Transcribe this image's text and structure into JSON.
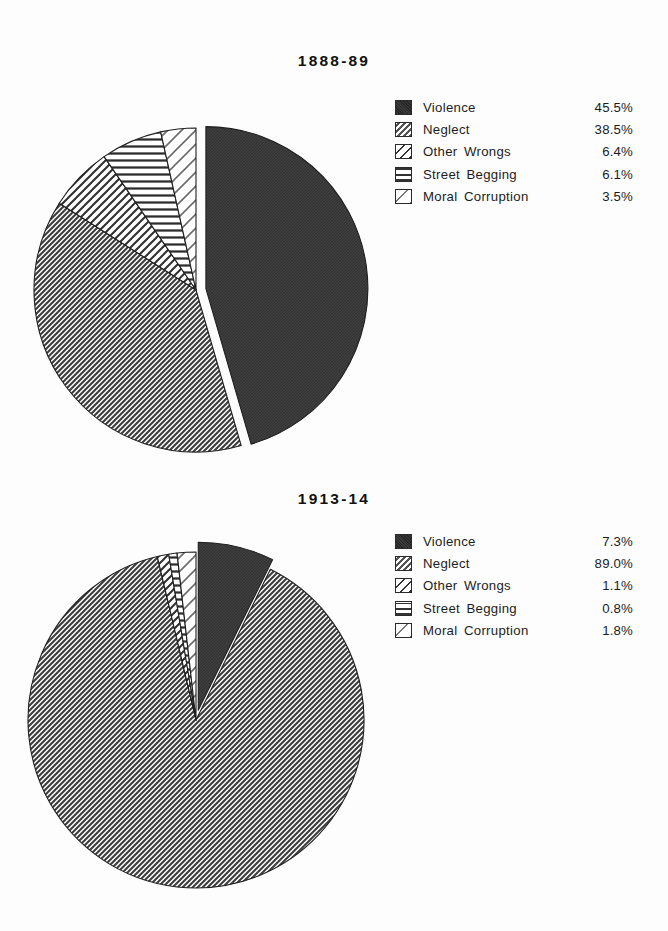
{
  "document": {
    "background": "#fdfdfd",
    "ink": "#1c1c1c"
  },
  "charts": [
    {
      "title": "1888-89",
      "legend": [
        {
          "label": "Violence",
          "value": "45.5%",
          "pattern": "solid",
          "swatch_name": "swatch-violence"
        },
        {
          "label": "Neglect",
          "value": "38.5%",
          "pattern": "dense-diag",
          "swatch_name": "swatch-neglect"
        },
        {
          "label": "Other Wrongs",
          "value": "6.4%",
          "pattern": "wide-diag",
          "swatch_name": "swatch-other-wrongs"
        },
        {
          "label": "Street Begging",
          "value": "6.1%",
          "pattern": "horiz",
          "swatch_name": "swatch-street-begging"
        },
        {
          "label": "Moral Corruption",
          "value": "3.5%",
          "pattern": "sparse-diag",
          "swatch_name": "swatch-moral-corruption"
        }
      ]
    },
    {
      "title": "1913-14",
      "legend": [
        {
          "label": "Violence",
          "value": "7.3%",
          "pattern": "solid",
          "swatch_name": "swatch-violence"
        },
        {
          "label": "Neglect",
          "value": "89.0%",
          "pattern": "dense-diag",
          "swatch_name": "swatch-neglect"
        },
        {
          "label": "Other Wrongs",
          "value": "1.1%",
          "pattern": "wide-diag",
          "swatch_name": "swatch-other-wrongs"
        },
        {
          "label": "Street Begging",
          "value": "0.8%",
          "pattern": "horiz",
          "swatch_name": "swatch-street-begging"
        },
        {
          "label": "Moral Corruption",
          "value": "1.8%",
          "pattern": "sparse-diag",
          "swatch_name": "swatch-moral-corruption"
        }
      ]
    }
  ],
  "chart_data": [
    {
      "type": "pie",
      "title": "1888-89",
      "labels": [
        "Violence",
        "Neglect",
        "Other Wrongs",
        "Street Begging",
        "Moral Corruption"
      ],
      "values": [
        45.5,
        38.5,
        6.4,
        6.1,
        3.5
      ],
      "value_labels": [
        "45.5%",
        "38.5%",
        "6.4%",
        "6.1%",
        "3.5%"
      ],
      "units": "percent",
      "total": 100.0,
      "start_angle_deg": 0,
      "direction": "clockwise",
      "exploded_slices": [
        "Violence"
      ],
      "explode_offset_px": 10,
      "slice_fills": [
        "solid-dark",
        "dense-diagonal",
        "wide-diagonal",
        "horizontal-lines",
        "sparse-diagonal"
      ],
      "legend_position": "right",
      "grid": false
    },
    {
      "type": "pie",
      "title": "1913-14",
      "labels": [
        "Violence",
        "Neglect",
        "Other Wrongs",
        "Street Begging",
        "Moral Corruption"
      ],
      "values": [
        7.3,
        89.0,
        1.1,
        0.8,
        1.8
      ],
      "value_labels": [
        "7.3%",
        "89.0%",
        "1.1%",
        "0.8%",
        "1.8%"
      ],
      "units": "percent",
      "total": 100.0,
      "start_angle_deg": 0,
      "direction": "clockwise",
      "exploded_slices": [
        "Violence"
      ],
      "explode_offset_px": 10,
      "slice_fills": [
        "solid-dark",
        "dense-diagonal",
        "wide-diagonal",
        "horizontal-lines",
        "sparse-diagonal"
      ],
      "legend_position": "right",
      "grid": false
    }
  ]
}
